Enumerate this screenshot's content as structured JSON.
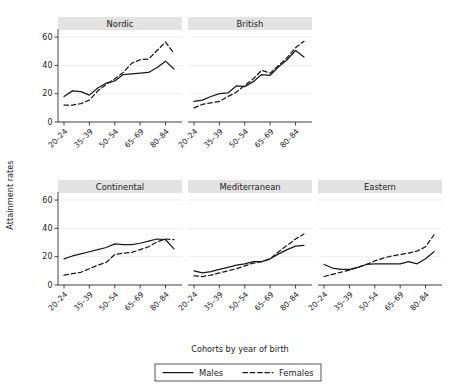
{
  "chart_data": {
    "type": "line",
    "title": "",
    "xlabel": "Cohorts by year of birth",
    "ylabel": "Attainment rates",
    "ylim": [
      0,
      65
    ],
    "yticks": [
      0,
      20,
      40,
      60
    ],
    "grid": true,
    "legend_position": "bottom",
    "legend": [
      "Males",
      "Females"
    ],
    "x": [
      "20-24",
      "25-29",
      "30-34",
      "35-39",
      "40-44",
      "45-49",
      "50-54",
      "55-59",
      "60-64",
      "65-69",
      "70-74",
      "75-79",
      "80-84",
      "85-89"
    ],
    "xticks": [
      "20-24",
      "35-39",
      "50-54",
      "65-69",
      "80-84"
    ],
    "panels": [
      {
        "name": "Nordic",
        "series": [
          {
            "name": "Males",
            "style": "solid",
            "values": [
              18.0,
              22.0,
              21.5,
              19.0,
              24.0,
              27.5,
              29.0,
              33.5,
              34.0,
              34.5,
              35.0,
              38.5,
              43.0,
              37.5
            ]
          },
          {
            "name": "Females",
            "style": "dashed",
            "values": [
              12.0,
              12.0,
              13.0,
              15.5,
              22.0,
              26.5,
              30.5,
              35.0,
              41.5,
              44.0,
              44.5,
              50.5,
              56.5,
              48.5
            ]
          }
        ]
      },
      {
        "name": "British",
        "series": [
          {
            "name": "Males",
            "style": "solid",
            "values": [
              14.5,
              15.5,
              18.0,
              20.0,
              20.5,
              25.5,
              25.0,
              28.5,
              33.5,
              33.0,
              39.0,
              44.0,
              50.5,
              46.0
            ]
          },
          {
            "name": "Females",
            "style": "dashed",
            "values": [
              10.0,
              12.5,
              13.5,
              14.5,
              18.0,
              21.0,
              26.0,
              30.5,
              36.5,
              34.5,
              40.0,
              45.5,
              52.5,
              57.0
            ]
          }
        ]
      },
      {
        "name": "Continental",
        "series": [
          {
            "name": "Males",
            "style": "solid",
            "values": [
              18.5,
              20.5,
              22.0,
              23.5,
              25.0,
              26.5,
              29.0,
              28.5,
              28.5,
              29.5,
              31.0,
              32.5,
              32.0,
              25.5
            ]
          },
          {
            "name": "Females",
            "style": "dashed",
            "values": [
              7.0,
              8.0,
              9.0,
              11.5,
              14.0,
              16.0,
              21.5,
              22.5,
              23.0,
              25.0,
              27.0,
              30.5,
              32.5,
              32.0
            ]
          }
        ]
      },
      {
        "name": "Mediterranean",
        "series": [
          {
            "name": "Males",
            "style": "solid",
            "values": [
              10.0,
              8.5,
              9.5,
              11.0,
              12.5,
              14.0,
              15.0,
              16.5,
              16.5,
              18.5,
              22.0,
              25.0,
              27.5,
              28.0
            ]
          },
          {
            "name": "Females",
            "style": "dashed",
            "values": [
              6.5,
              6.0,
              7.0,
              8.5,
              10.0,
              11.5,
              13.5,
              15.5,
              16.5,
              18.5,
              23.5,
              28.0,
              32.5,
              36.0
            ]
          }
        ]
      },
      {
        "name": "Eastern",
        "series": [
          {
            "name": "Males",
            "style": "solid",
            "values": [
              14.5,
              12.0,
              11.0,
              11.0,
              12.5,
              14.5,
              15.0,
              15.0,
              15.0,
              15.0,
              16.5,
              15.0,
              18.5,
              23.5
            ]
          },
          {
            "name": "Females",
            "style": "dashed",
            "values": [
              6.0,
              7.5,
              9.0,
              10.5,
              12.5,
              14.5,
              17.0,
              19.0,
              20.5,
              21.5,
              22.5,
              24.0,
              27.0,
              35.5
            ]
          }
        ]
      }
    ]
  }
}
